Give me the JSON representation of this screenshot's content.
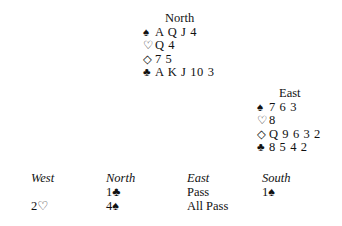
{
  "north": {
    "title": "North",
    "suits": [
      {
        "symbol": "♠",
        "cards": "A Q J 4"
      },
      {
        "symbol": "♡",
        "cards": "Q 4"
      },
      {
        "symbol": "◇",
        "cards": "7 5"
      },
      {
        "symbol": "♣",
        "cards": "A K J 10 3"
      }
    ]
  },
  "east": {
    "title": "East",
    "suits": [
      {
        "symbol": "♠",
        "cards": "7 6 3"
      },
      {
        "symbol": "♡",
        "cards": "8"
      },
      {
        "symbol": "◇",
        "cards": "Q 9 6 3 2"
      },
      {
        "symbol": "♣",
        "cards": "8 5 4 2"
      }
    ]
  },
  "auction": {
    "headers": [
      "West",
      "North",
      "East",
      "South"
    ],
    "rows": [
      [
        "",
        "1♣",
        "Pass",
        "1♠"
      ],
      [
        "2♡",
        "4♠",
        "All Pass",
        ""
      ]
    ]
  }
}
